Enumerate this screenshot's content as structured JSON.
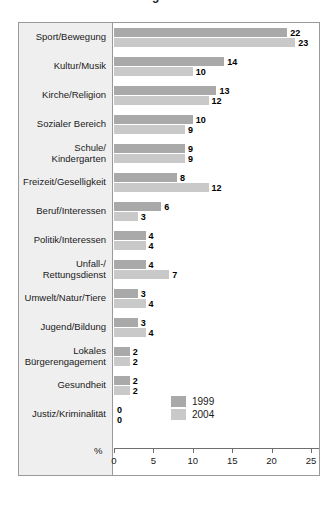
{
  "title_fragment": "g",
  "axis": {
    "percent_symbol": "%",
    "ticks": [
      0,
      5,
      10,
      15,
      20,
      25
    ],
    "tick_labels": [
      "0",
      "5",
      "10",
      "15",
      "20",
      "25"
    ]
  },
  "legend": {
    "items": [
      {
        "label": "1999",
        "color": "#a9a9a9"
      },
      {
        "label": "2004",
        "color": "#c9c9c9"
      }
    ]
  },
  "chart_data": {
    "type": "bar",
    "orientation": "horizontal",
    "title": "",
    "xlabel": "%",
    "ylabel": "",
    "xlim": [
      0,
      25
    ],
    "grid": false,
    "legend_position": "bottom-right",
    "categories": [
      "Sport/Bewegung",
      "Kultur/Musik",
      "Kirche/Religion",
      "Sozialer Bereich",
      "Schule/\nKindergarten",
      "Freizeit/Geselligkeit",
      "Beruf/Interessen",
      "Politik/Interessen",
      "Unfall-/\nRettungsdienst",
      "Umwelt/Natur/Tiere",
      "Jugend/Bildung",
      "Lokales\nBürgerengagement",
      "Gesundheit",
      "Justiz/Kriminalität"
    ],
    "series": [
      {
        "name": "1999",
        "color": "#a9a9a9",
        "values": [
          22,
          14,
          13,
          10,
          9,
          8,
          6,
          4,
          4,
          3,
          3,
          2,
          2,
          0
        ]
      },
      {
        "name": "2004",
        "color": "#c9c9c9",
        "values": [
          23,
          10,
          12,
          9,
          9,
          12,
          3,
          4,
          7,
          4,
          4,
          2,
          2,
          0
        ]
      }
    ]
  }
}
